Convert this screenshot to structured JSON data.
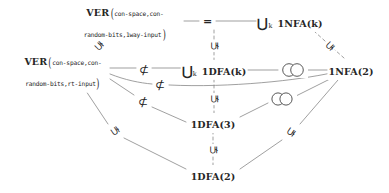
{
  "diagram": {
    "width": 389,
    "height": 193,
    "background": "#ffffff",
    "line_color": "#8a8a8a",
    "text_color": "#262626",
    "nodes": [
      {
        "id": "ver-1way",
        "label": "VER(con-space,con-random-bits,1way-input)",
        "head": "VER",
        "arg_line1": "con-space,con-",
        "arg_line2": "random-bits,1way-input",
        "x": 125,
        "y": 22
      },
      {
        "id": "union-1nfa-k",
        "label": "⋃k 1NFA(k)",
        "union": "⋃",
        "sub": "k",
        "main": "1NFA(k)",
        "x": 290,
        "y": 22
      },
      {
        "id": "ver-rt",
        "label": "VER(con-space,con-random-bits,rt-input)",
        "head": "VER",
        "arg_line1": "con-space,con-",
        "arg_line2": "random-bits,rt-input",
        "x": 63,
        "y": 71
      },
      {
        "id": "union-1dfa-k",
        "label": "⋃k 1DFA(k)",
        "union": "⋃",
        "sub": "k",
        "main": "1DFA(k)",
        "x": 214,
        "y": 70
      },
      {
        "id": "1nfa-2",
        "label": "1NFA(2)",
        "main": "1NFA(2)",
        "x": 351,
        "y": 70
      },
      {
        "id": "1dfa-3",
        "label": "1DFA(3)",
        "main": "1DFA(3)",
        "x": 213,
        "y": 123
      },
      {
        "id": "1dfa-2",
        "label": "1DFA(2)",
        "main": "1DFA(2)",
        "x": 213,
        "y": 175
      }
    ],
    "relations": [
      {
        "id": "rel-eq-top",
        "symbol": "=",
        "kind": "equals",
        "between": [
          "ver-1way",
          "union-1nfa-k"
        ],
        "x": 207,
        "y": 21
      },
      {
        "id": "rel-nsub-mid",
        "symbol": "⊄",
        "kind": "not-subset",
        "between": [
          "ver-rt",
          "union-1dfa-k"
        ],
        "x": 144,
        "y": 70
      },
      {
        "id": "rel-nsub-low",
        "symbol": "⊄",
        "kind": "not-subset",
        "between": [
          "ver-rt",
          "1nfa-2"
        ],
        "x": 160,
        "y": 85
      },
      {
        "id": "rel-nsub-diag",
        "symbol": "⊄",
        "kind": "not-subset",
        "between": [
          "ver-rt",
          "1dfa-3"
        ],
        "x": 143,
        "y": 103
      },
      {
        "id": "rel-sub-v-top",
        "symbol": "⊊",
        "kind": "subsetneq-up",
        "between": [
          "union-1dfa-k",
          "union-1nfa-k"
        ],
        "x": 214,
        "y": 46
      },
      {
        "id": "rel-sub-v-mid",
        "symbol": "⊊",
        "kind": "subsetneq-up",
        "between": [
          "1dfa-3",
          "union-1dfa-k"
        ],
        "x": 214,
        "y": 99
      },
      {
        "id": "rel-sub-v-bot",
        "symbol": "⊊",
        "kind": "subsetneq-up",
        "between": [
          "1dfa-2",
          "1dfa-3"
        ],
        "x": 214,
        "y": 150
      },
      {
        "id": "rel-sub-d-topleft",
        "symbol": "⊊",
        "kind": "subsetneq-rot",
        "between": [
          "ver-rt",
          "ver-1way"
        ],
        "x": 99,
        "y": 46
      },
      {
        "id": "rel-sub-d-topright",
        "symbol": "⊊",
        "kind": "subsetneq-rot",
        "between": [
          "1nfa-2",
          "union-1nfa-k"
        ],
        "x": 330,
        "y": 46
      },
      {
        "id": "rel-sub-d-botleft",
        "symbol": "⊊",
        "kind": "subsetneq-rot",
        "between": [
          "1dfa-2",
          "ver-rt"
        ],
        "x": 115,
        "y": 130
      },
      {
        "id": "rel-sub-d-botright",
        "symbol": "⊊",
        "kind": "subsetneq-rot",
        "between": [
          "1dfa-2",
          "1nfa-2"
        ],
        "x": 290,
        "y": 131
      },
      {
        "id": "rel-incomp-upper",
        "symbol": "○○",
        "kind": "incomparable",
        "between": [
          "union-1dfa-k",
          "1nfa-2"
        ],
        "x": 293,
        "y": 70
      },
      {
        "id": "rel-incomp-lower",
        "symbol": "○○",
        "kind": "incomparable",
        "between": [
          "1dfa-3",
          "1nfa-2"
        ],
        "x": 282,
        "y": 99
      }
    ],
    "edges": [
      {
        "id": "edge-ver1way-eq",
        "from": "ver-1way",
        "to": "rel-eq-top",
        "style": "solid"
      },
      {
        "id": "edge-eq-union1nfa",
        "from": "rel-eq-top",
        "to": "union-1nfa-k",
        "style": "solid"
      },
      {
        "id": "edge-verrt-union1dfa",
        "from": "ver-rt",
        "to": "union-1dfa-k",
        "style": "solid"
      },
      {
        "id": "edge-verrt-1nfa2",
        "from": "ver-rt",
        "to": "1nfa-2",
        "style": "curve"
      },
      {
        "id": "edge-verrt-1dfa3",
        "from": "ver-rt",
        "to": "1dfa-3",
        "style": "solid"
      },
      {
        "id": "edge-verrt-ver1way",
        "from": "ver-rt",
        "to": "ver-1way",
        "style": "dashed"
      },
      {
        "id": "edge-verrt-1dfa2",
        "from": "ver-rt",
        "to": "1dfa-2",
        "style": "solid"
      },
      {
        "id": "edge-union1dfa-union1nfa",
        "from": "union-1dfa-k",
        "to": "union-1nfa-k",
        "style": "dashed-vertical"
      },
      {
        "id": "edge-union1dfa-1nfa2",
        "from": "union-1dfa-k",
        "to": "1nfa-2",
        "style": "solid"
      },
      {
        "id": "edge-union1dfa-1dfa3",
        "from": "union-1dfa-k",
        "to": "1dfa-3",
        "style": "dashed-vertical"
      },
      {
        "id": "edge-1dfa3-1nfa2",
        "from": "1dfa-3",
        "to": "1nfa-2",
        "style": "solid"
      },
      {
        "id": "edge-1dfa3-1dfa2",
        "from": "1dfa-3",
        "to": "1dfa-2",
        "style": "dashed-vertical"
      },
      {
        "id": "edge-1dfa2-1nfa2",
        "from": "1dfa-2",
        "to": "1nfa-2",
        "style": "solid"
      },
      {
        "id": "edge-1nfa2-union1nfa",
        "from": "1nfa-2",
        "to": "union-1nfa-k",
        "style": "dashed"
      }
    ]
  }
}
